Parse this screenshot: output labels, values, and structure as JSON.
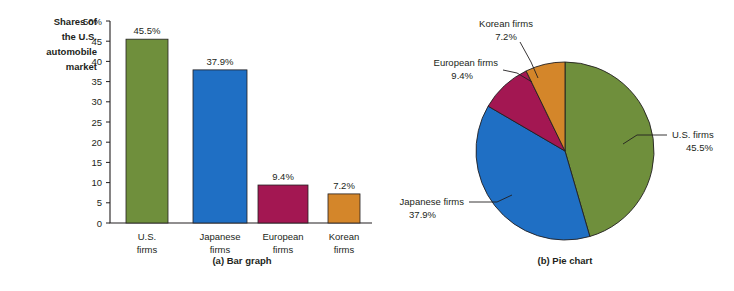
{
  "figure": {
    "background": "#ffffff",
    "outline_color": "#231f20"
  },
  "chart_data": [
    {
      "type": "bar",
      "panel": "a",
      "caption": "(a) Bar graph",
      "title": "",
      "ylabel": "Shares of the U.S. automobile market",
      "ylabel_lines": [
        "Shares of",
        "the U.S.",
        "automobile",
        "market"
      ],
      "xlabel": "",
      "ylim": [
        0,
        50
      ],
      "yticks": [
        0,
        5,
        10,
        15,
        20,
        25,
        30,
        35,
        40,
        45,
        50
      ],
      "ytick_labels": [
        "0",
        "5",
        "10",
        "15",
        "20",
        "25",
        "30",
        "35",
        "40",
        "45",
        "50%"
      ],
      "grid": false,
      "legend": "none",
      "categories": [
        "U.S. firms",
        "Japanese firms",
        "European firms",
        "Korean firms"
      ],
      "category_lines": [
        [
          "U.S.",
          "firms"
        ],
        [
          "Japanese",
          "firms"
        ],
        [
          "European",
          "firms"
        ],
        [
          "Korean",
          "firms"
        ]
      ],
      "values": [
        45.5,
        37.9,
        9.4,
        7.2
      ],
      "data_labels": [
        "45.5%",
        "37.9%",
        "9.4%",
        "7.2%"
      ],
      "colors": [
        "#6f8f3c",
        "#1f6fc4",
        "#a31752",
        "#d4862a"
      ]
    },
    {
      "type": "pie",
      "panel": "b",
      "caption": "(b) Pie chart",
      "title": "",
      "legend": "callout-labels",
      "start_angle_deg": 0,
      "direction": "clockwise",
      "labels": [
        "U.S. firms",
        "Japanese firms",
        "European firms",
        "Korean firms"
      ],
      "values": [
        45.5,
        37.9,
        9.4,
        7.2
      ],
      "data_labels": [
        "45.5%",
        "37.9%",
        "9.4%",
        "7.2%"
      ],
      "colors": [
        "#6f8f3c",
        "#1f6fc4",
        "#a31752",
        "#d4862a"
      ],
      "callouts": [
        {
          "name": "U.S. firms",
          "value": "45.5%",
          "anchor": "start",
          "x": 664,
          "y": 140
        },
        {
          "name": "Japanese firms",
          "value": "37.9%",
          "anchor": "end",
          "x": 466,
          "y": 208
        },
        {
          "name": "European firms",
          "value": "9.4%",
          "anchor": "end",
          "x": 500,
          "y": 66
        },
        {
          "name": "Korean firms",
          "value": "7.2%",
          "anchor": "middle",
          "x": 506,
          "y": 27
        }
      ]
    }
  ]
}
